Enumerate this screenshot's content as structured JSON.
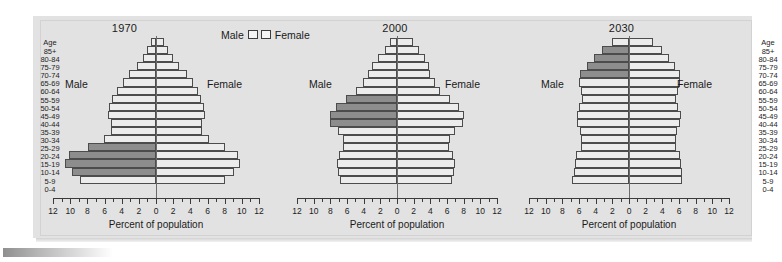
{
  "figure": {
    "legend": {
      "male_label": "Male",
      "female_label": "Female",
      "male_swatch": "legend-swatch-male",
      "female_swatch": "legend-swatch-female"
    },
    "age_header": "Age",
    "age_groups": [
      "85+",
      "80-84",
      "75-79",
      "70-74",
      "65-69",
      "60-64",
      "55-59",
      "50-54",
      "45-49",
      "40-44",
      "35-39",
      "30-34",
      "25-29",
      "20-24",
      "15-19",
      "10-14",
      "5-9",
      "0-4"
    ],
    "x_tick_labels": [
      "12",
      "10",
      "8",
      "6",
      "4",
      "2",
      "0",
      "2",
      "4",
      "6",
      "8",
      "10",
      "12"
    ],
    "x_axis_title": "Percent of population",
    "male_note": "Male",
    "female_note": "Female",
    "colors": {
      "panel_background": "#e2e2e2",
      "bar_light": "#ececec",
      "bar_highlight": "#8d8d8d",
      "bar_outline": "#4c4c4c",
      "axis": "#3a3a3a",
      "text": "#1a1a1a"
    }
  },
  "chart_data": [
    {
      "type": "bar",
      "title": "1970",
      "xlabel": "Percent of population",
      "ylabel": "Age",
      "xlim": [
        -12,
        12
      ],
      "grid": false,
      "legend_position": "top-center",
      "categories": [
        "85+",
        "80-84",
        "75-79",
        "70-74",
        "65-69",
        "60-64",
        "55-59",
        "50-54",
        "45-49",
        "40-44",
        "35-39",
        "30-34",
        "25-29",
        "20-24",
        "15-19",
        "10-14",
        "5-9",
        "0-4"
      ],
      "series": [
        {
          "name": "Male",
          "values": [
            0.6,
            1.0,
            1.5,
            2.2,
            3.1,
            3.9,
            4.6,
            5.1,
            5.5,
            5.6,
            5.3,
            5.3,
            6.1,
            7.9,
            10.1,
            10.6,
            9.8,
            8.9
          ]
        },
        {
          "name": "Female",
          "values": [
            0.9,
            1.4,
            2.0,
            2.7,
            3.6,
            4.3,
            4.9,
            5.3,
            5.6,
            5.7,
            5.4,
            5.4,
            6.2,
            8.0,
            9.5,
            9.8,
            9.1,
            8.0
          ]
        }
      ],
      "highlighted_categories": [
        "20-24",
        "15-19",
        "10-14",
        "5-9"
      ],
      "highlight_note": "baby-boom cohort"
    },
    {
      "type": "bar",
      "title": "2000",
      "xlabel": "Percent of population",
      "ylabel": "Age",
      "xlim": [
        -12,
        12
      ],
      "grid": false,
      "legend_position": "top-center",
      "categories": [
        "85+",
        "80-84",
        "75-79",
        "70-74",
        "65-69",
        "60-64",
        "55-59",
        "50-54",
        "45-49",
        "40-44",
        "35-39",
        "30-34",
        "25-29",
        "20-24",
        "15-19",
        "10-14",
        "5-9",
        "0-4"
      ],
      "series": [
        {
          "name": "Male",
          "values": [
            0.8,
            1.5,
            2.3,
            3.0,
            3.5,
            4.1,
            4.9,
            6.1,
            7.3,
            8.0,
            8.0,
            7.1,
            6.5,
            6.5,
            7.0,
            7.2,
            7.1,
            6.9
          ]
        },
        {
          "name": "Female",
          "values": [
            1.9,
            2.6,
            3.3,
            3.8,
            4.0,
            4.5,
            5.2,
            6.3,
            7.4,
            8.0,
            7.9,
            7.0,
            6.3,
            6.2,
            6.7,
            6.9,
            6.8,
            6.6
          ]
        }
      ],
      "highlighted_categories": [
        "50-54",
        "45-49",
        "40-44",
        "35-39"
      ],
      "highlight_note": "baby-boom cohort"
    },
    {
      "type": "bar",
      "title": "2030",
      "xlabel": "Percent of population",
      "ylabel": "Age",
      "xlim": [
        -12,
        12
      ],
      "grid": false,
      "legend_position": "top-center",
      "categories": [
        "85+",
        "80-84",
        "75-79",
        "70-74",
        "65-69",
        "60-64",
        "55-59",
        "50-54",
        "45-49",
        "40-44",
        "35-39",
        "30-34",
        "25-29",
        "20-24",
        "15-19",
        "10-14",
        "5-9",
        "0-4"
      ],
      "series": [
        {
          "name": "Male",
          "values": [
            2.1,
            3.3,
            4.2,
            5.1,
            5.9,
            6.0,
            5.8,
            5.6,
            6.0,
            6.3,
            6.2,
            5.9,
            5.8,
            5.8,
            6.4,
            6.5,
            6.6,
            6.8
          ]
        },
        {
          "name": "Female",
          "values": [
            2.9,
            4.0,
            4.8,
            5.5,
            6.1,
            6.1,
            5.9,
            5.6,
            5.9,
            6.2,
            6.1,
            5.8,
            5.6,
            5.6,
            6.1,
            6.2,
            6.3,
            6.4
          ]
        }
      ],
      "highlighted_categories": [
        "80-84",
        "75-79",
        "70-74",
        "65-69"
      ],
      "highlight_note": "baby-boom cohort"
    }
  ]
}
